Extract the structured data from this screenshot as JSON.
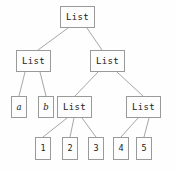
{
  "diagram": {
    "type": "tree",
    "colors": {
      "background": "#fefefe",
      "node_border": "#9a9a9a",
      "node_fill": "#fdfdfd",
      "edge": "#a6a6a6",
      "text": "#1a1a1a"
    },
    "nodes": [
      {
        "id": "root",
        "label": "List",
        "kind": "list",
        "x": 60,
        "y": 6,
        "w": 35,
        "h": 22
      },
      {
        "id": "l1",
        "label": "List",
        "kind": "list",
        "x": 16,
        "y": 50,
        "w": 35,
        "h": 22
      },
      {
        "id": "r1",
        "label": "List",
        "kind": "list",
        "x": 90,
        "y": 50,
        "w": 35,
        "h": 22
      },
      {
        "id": "a",
        "label": "a",
        "kind": "var",
        "x": 11,
        "y": 96,
        "w": 16,
        "h": 22
      },
      {
        "id": "b",
        "label": "b",
        "kind": "var",
        "x": 38,
        "y": 96,
        "w": 16,
        "h": 22
      },
      {
        "id": "l2",
        "label": "List",
        "kind": "list",
        "x": 57,
        "y": 96,
        "w": 35,
        "h": 22
      },
      {
        "id": "r2",
        "label": "List",
        "kind": "list",
        "x": 126,
        "y": 96,
        "w": 35,
        "h": 22
      },
      {
        "id": "n1",
        "label": "1",
        "kind": "leaf",
        "x": 35,
        "y": 137,
        "w": 16,
        "h": 23
      },
      {
        "id": "n2",
        "label": "2",
        "kind": "leaf",
        "x": 62,
        "y": 137,
        "w": 16,
        "h": 23
      },
      {
        "id": "n3",
        "label": "3",
        "kind": "leaf",
        "x": 88,
        "y": 137,
        "w": 16,
        "h": 23
      },
      {
        "id": "n4",
        "label": "4",
        "kind": "leaf",
        "x": 113,
        "y": 137,
        "w": 16,
        "h": 23
      },
      {
        "id": "n5",
        "label": "5",
        "kind": "leaf",
        "x": 136,
        "y": 137,
        "w": 16,
        "h": 23
      }
    ],
    "edges": [
      {
        "from": "root",
        "to": "l1",
        "x1": 68,
        "y1": 28,
        "x2": 38,
        "y2": 50
      },
      {
        "from": "root",
        "to": "r1",
        "x1": 87,
        "y1": 28,
        "x2": 102,
        "y2": 50
      },
      {
        "from": "l1",
        "to": "a",
        "x1": 25,
        "y1": 72,
        "x2": 19,
        "y2": 96
      },
      {
        "from": "l1",
        "to": "b",
        "x1": 40,
        "y1": 72,
        "x2": 46,
        "y2": 96
      },
      {
        "from": "r1",
        "to": "l2",
        "x1": 98,
        "y1": 72,
        "x2": 75,
        "y2": 96
      },
      {
        "from": "r1",
        "to": "r2",
        "x1": 117,
        "y1": 72,
        "x2": 143,
        "y2": 96
      },
      {
        "from": "l2",
        "to": "n1",
        "x1": 67,
        "y1": 118,
        "x2": 43,
        "y2": 137
      },
      {
        "from": "l2",
        "to": "n2",
        "x1": 74,
        "y1": 118,
        "x2": 70,
        "y2": 137
      },
      {
        "from": "l2",
        "to": "n3",
        "x1": 82,
        "y1": 118,
        "x2": 96,
        "y2": 137
      },
      {
        "from": "r2",
        "to": "n4",
        "x1": 138,
        "y1": 118,
        "x2": 121,
        "y2": 137
      },
      {
        "from": "r2",
        "to": "n5",
        "x1": 149,
        "y1": 118,
        "x2": 144,
        "y2": 137
      }
    ]
  }
}
